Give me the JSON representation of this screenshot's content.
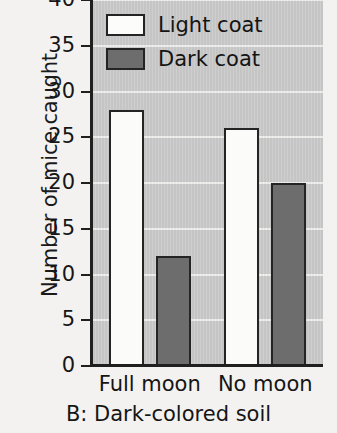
{
  "chart_data": {
    "type": "bar",
    "title": "B: Dark-colored soil",
    "xlabel": "",
    "ylabel": "Number of mice caught",
    "categories": [
      "Full moon",
      "No moon"
    ],
    "series": [
      {
        "name": "Light coat",
        "values": [
          28,
          26
        ],
        "color": "#fbfbfa"
      },
      {
        "name": "Dark coat",
        "values": [
          12,
          20
        ],
        "color": "#6d6d6d"
      }
    ],
    "ylim": [
      0,
      40
    ],
    "yticks": [
      0,
      5,
      10,
      15,
      20,
      25,
      30,
      35,
      40
    ],
    "ytick_labels": [
      "0",
      "5",
      "10",
      "15",
      "20",
      "25",
      "30",
      "35",
      "40"
    ],
    "grid": true,
    "grid_axis": "y",
    "legend_position": "top-left",
    "plot_background": "#c9c9c9",
    "figure_background": "#f3f2f0",
    "gridline_color": "#f0f0ee",
    "bar_edge_color": "#242424"
  },
  "legend": {
    "entries": [
      {
        "label": "Light coat",
        "swatch": "light"
      },
      {
        "label": "Dark coat",
        "swatch": "dark"
      }
    ]
  }
}
